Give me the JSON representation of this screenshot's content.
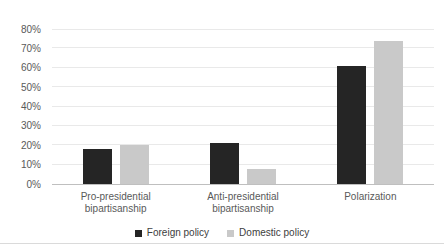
{
  "chart_data": {
    "type": "bar",
    "categories": [
      "Pro-presidential bipartisanship",
      "Anti-presidential bipartisanship",
      "Polarization"
    ],
    "series": [
      {
        "name": "Foreign policy",
        "color": "#252525",
        "values": [
          18,
          21,
          61
        ]
      },
      {
        "name": "Domestic policy",
        "color": "#c9c9c9",
        "values": [
          20,
          8,
          74
        ]
      }
    ],
    "title": "",
    "xlabel": "",
    "ylabel": "",
    "ylim": [
      0,
      80
    ],
    "ytick_step": 10,
    "yticks": [
      "0%",
      "10%",
      "20%",
      "30%",
      "40%",
      "50%",
      "60%",
      "70%",
      "80%"
    ],
    "grid": true,
    "gridline_color": "#e9e9e9",
    "axis_line_color": "#bfbfbf",
    "legend_position": "bottom"
  }
}
